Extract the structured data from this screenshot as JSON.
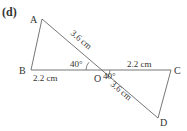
{
  "figure_label": "(d)",
  "points": {
    "A": {
      "label": "A",
      "x": 42,
      "y": 19
    },
    "B": {
      "label": "B",
      "x": 31,
      "y": 70
    },
    "O": {
      "label": "O",
      "x": 98,
      "y": 70
    },
    "C": {
      "label": "C",
      "x": 171,
      "y": 70
    },
    "D": {
      "label": "D",
      "x": 158,
      "y": 118
    }
  },
  "measurements": {
    "AO": "3.6 cm",
    "BO": "2.2 cm",
    "OC": "2.2 cm",
    "OD": "3.6 cm",
    "angle_AOB": "40°",
    "angle_COD": "40°"
  },
  "colors": {
    "line": "#555555",
    "text": "#333333"
  }
}
